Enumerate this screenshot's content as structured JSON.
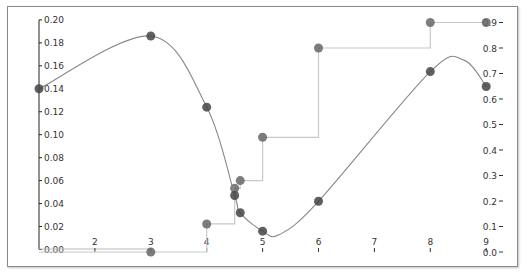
{
  "chart_data": {
    "type": "line",
    "title": "",
    "xlabel": "",
    "ylabel": "",
    "xlim": [
      1,
      9
    ],
    "x_ticks": [
      "2",
      "3",
      "4",
      "5",
      "6",
      "7",
      "8",
      "9"
    ],
    "left_axis": {
      "ylim": [
        0.0,
        0.2
      ],
      "ticks": [
        "0.00",
        "0.02",
        "0.04",
        "0.06",
        "0.08",
        "0.10",
        "0.12",
        "0.14",
        "0.16",
        "0.18",
        "0.20"
      ]
    },
    "right_axis": {
      "ylim": [
        0.0,
        0.9
      ],
      "ticks": [
        "0.0",
        "0.1",
        "0.2",
        "0.3",
        "0.4",
        "0.5",
        "0.6",
        "0.7",
        "0.8",
        "0.9"
      ]
    },
    "grid": false,
    "legend": null,
    "series": [
      {
        "name": "density (smooth curve)",
        "axis": "left",
        "style": "smooth line with markers",
        "color": "#555555",
        "x": [
          1,
          3,
          4,
          4.5,
          4.6,
          5,
          6,
          8,
          9
        ],
        "values": [
          0.14,
          0.186,
          0.124,
          0.047,
          0.032,
          0.016,
          0.042,
          0.155,
          0.142
        ]
      },
      {
        "name": "cumulative (step)",
        "axis": "right",
        "style": "step line with markers",
        "color": "#888888",
        "x": [
          3,
          4,
          4.5,
          4.6,
          5,
          6,
          8,
          9
        ],
        "values": [
          0.0,
          0.11,
          0.25,
          0.28,
          0.45,
          0.8,
          0.9,
          0.9
        ]
      }
    ]
  }
}
